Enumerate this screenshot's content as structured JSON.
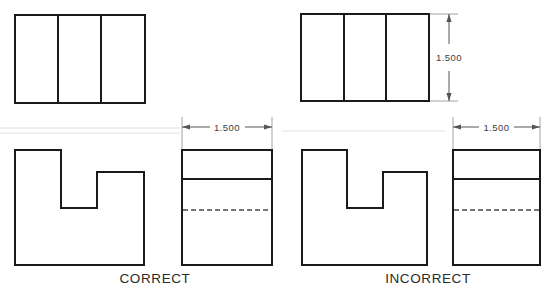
{
  "figure": {
    "background_color": "#ffffff",
    "line_color": "#1a1a1a",
    "hidden_line_color": "#4a4a4a",
    "dimension_color": "#555555"
  },
  "captions": {
    "correct": "CORRECT",
    "incorrect": "INCORRECT"
  },
  "dimensions": {
    "top_right_vertical": {
      "value": "1.500",
      "orientation": "vertical"
    },
    "middle_horizontal": {
      "value": "1.500",
      "orientation": "horizontal"
    },
    "right_horizontal": {
      "value": "1.500",
      "orientation": "horizontal"
    }
  },
  "views": {
    "top_left": {
      "label": "top-view-correct",
      "panels": 3
    },
    "top_right": {
      "label": "top-view-incorrect",
      "panels": 3
    },
    "front_left": {
      "label": "front-view-correct-notched-profile"
    },
    "front_right": {
      "label": "front-view-incorrect-notched-profile"
    },
    "side_left": {
      "label": "side-view-correct",
      "visible_line": true,
      "hidden_line": true
    },
    "side_right": {
      "label": "side-view-incorrect",
      "visible_line": true,
      "hidden_line": true
    }
  }
}
